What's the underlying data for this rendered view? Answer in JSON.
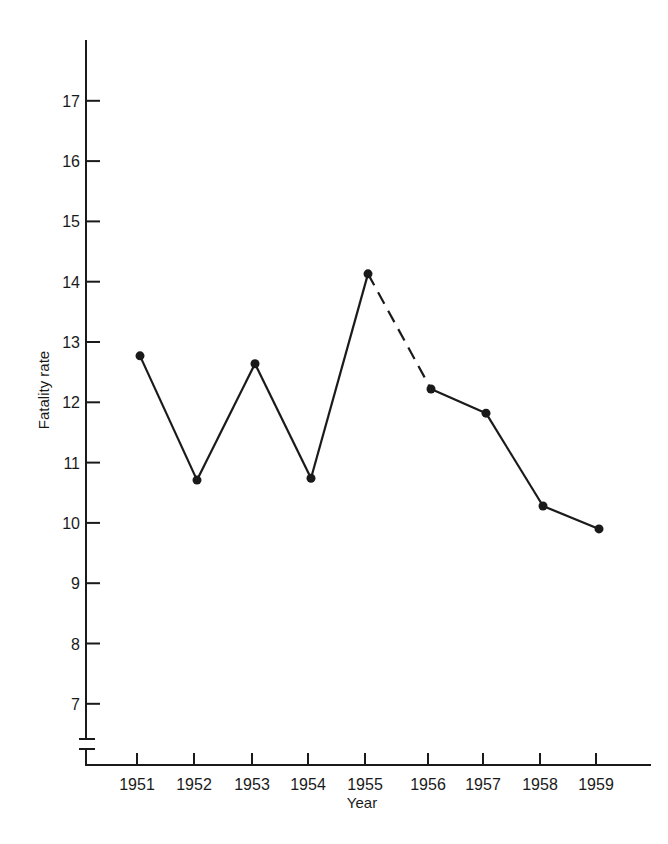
{
  "chart_data": {
    "type": "line",
    "title": "",
    "xlabel": "Year",
    "ylabel": "Fatality rate",
    "categories": [
      "1951",
      "1952",
      "1953",
      "1954",
      "1955",
      "1956",
      "1957",
      "1958",
      "1959"
    ],
    "series": [
      {
        "name": "Fatality rate",
        "values": [
          12.77,
          10.71,
          12.64,
          10.74,
          14.13,
          12.22,
          11.82,
          10.28,
          9.9
        ],
        "dashed_segments": [
          [
            4,
            5
          ]
        ],
        "marker": "filled-circle",
        "color": "#1a1a1a"
      }
    ],
    "yticks": [
      7,
      8,
      9,
      10,
      11,
      12,
      13,
      14,
      15,
      16,
      17
    ],
    "ylim": [
      6.5,
      18
    ],
    "y_axis_break": true,
    "grid": false,
    "legend": "none"
  },
  "axis": {
    "x_title": "Year",
    "y_title": "Fatality rate"
  }
}
